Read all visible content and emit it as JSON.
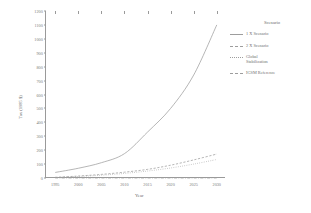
{
  "chart_data": {
    "type": "line",
    "title": "",
    "xlabel": "Year",
    "ylabel": "Tax (1985 $)",
    "xlim": [
      1993,
      2032
    ],
    "ylim": [
      0,
      1200
    ],
    "xticks": [
      1995,
      2000,
      2005,
      2010,
      2015,
      2020,
      2025,
      2030
    ],
    "yticks": [
      0,
      100,
      200,
      300,
      400,
      500,
      600,
      700,
      800,
      900,
      1000,
      1100,
      1200
    ],
    "grid": false,
    "legend_position": "right",
    "legend_title": "Scenario",
    "x": [
      1995,
      2000,
      2005,
      2010,
      2015,
      2020,
      2025,
      2030
    ],
    "series": [
      {
        "name": "1 X Scenario",
        "style": "solid",
        "values": [
          40,
          70,
          110,
          175,
          330,
          500,
          740,
          1100
        ]
      },
      {
        "name": "2 X Scenario",
        "style": "dashed",
        "values": [
          5,
          14,
          26,
          42,
          62,
          92,
          130,
          172
        ]
      },
      {
        "name": "Global Stabilization",
        "style": "dotted",
        "values": [
          4,
          11,
          20,
          33,
          50,
          72,
          100,
          133
        ]
      },
      {
        "name": "IGSM Reference",
        "style": "dash-dot",
        "values": [
          0,
          0,
          0,
          0,
          0,
          0,
          0,
          0
        ]
      }
    ]
  },
  "axes": {
    "ylabel": "Tax (1985 $)",
    "xlabel": "Year",
    "ytick_labels": [
      "1200",
      "1100",
      "1000",
      "900",
      "800",
      "700",
      "600",
      "500",
      "400",
      "300",
      "200",
      "100",
      "0"
    ],
    "xtick_labels": [
      "1995",
      "2000",
      "2005",
      "2010",
      "2015",
      "2020",
      "2025",
      "2030"
    ]
  },
  "legend": {
    "title": "Scenario",
    "items": [
      {
        "label": "1 X Scenario",
        "swatch": "line-solid-icon"
      },
      {
        "label": "2 X Scenario",
        "swatch": "line-dashed-icon"
      },
      {
        "label": "Global\nStabilization",
        "swatch": "line-dotted-icon"
      },
      {
        "label": "IGSM Reference",
        "swatch": "line-dash-dot-icon"
      }
    ]
  },
  "colors": {
    "line": "#9d9d9d",
    "axis": "#9a9a9a",
    "text": "#6f6f6f",
    "background": "#ffffff"
  }
}
